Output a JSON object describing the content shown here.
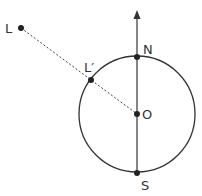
{
  "diagram": {
    "labels": {
      "L": "L",
      "L_prime": "L′",
      "N": "N",
      "O": "O",
      "S": "S"
    },
    "colors": {
      "stroke": "#333333",
      "background": "#ffffff"
    }
  }
}
